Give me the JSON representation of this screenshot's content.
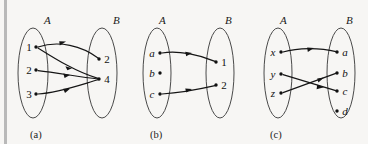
{
  "figure": {
    "background_color": "#f7f6f4",
    "ink_color": "#151515",
    "oval_color": "#4a4a4a",
    "edge_bar_color": "#b9b9b9"
  },
  "panels": [
    {
      "caption": "(a)",
      "domain_label": "A",
      "codomain_label": "B",
      "domain_nodes": [
        {
          "id": "1",
          "label": "1",
          "numeric": true
        },
        {
          "id": "2",
          "label": "2",
          "numeric": true
        },
        {
          "id": "3",
          "label": "3",
          "numeric": true
        }
      ],
      "codomain_nodes": [
        {
          "id": "2",
          "label": "2",
          "numeric": true
        },
        {
          "id": "4",
          "label": "4",
          "numeric": true
        }
      ],
      "arrows": [
        {
          "from": "1",
          "to": "2"
        },
        {
          "from": "1",
          "to": "4"
        },
        {
          "from": "2",
          "to": "4"
        },
        {
          "from": "3",
          "to": "4"
        }
      ]
    },
    {
      "caption": "(b)",
      "domain_label": "A",
      "codomain_label": "B",
      "domain_nodes": [
        {
          "id": "a",
          "label": "a",
          "numeric": false
        },
        {
          "id": "b",
          "label": "b",
          "numeric": false
        },
        {
          "id": "c",
          "label": "c",
          "numeric": false
        }
      ],
      "codomain_nodes": [
        {
          "id": "1",
          "label": "1",
          "numeric": true
        },
        {
          "id": "2",
          "label": "2",
          "numeric": true
        }
      ],
      "arrows": [
        {
          "from": "a",
          "to": "1"
        },
        {
          "from": "c",
          "to": "2"
        }
      ]
    },
    {
      "caption": "(c)",
      "domain_label": "A",
      "codomain_label": "B",
      "domain_nodes": [
        {
          "id": "x",
          "label": "x",
          "numeric": false
        },
        {
          "id": "y",
          "label": "y",
          "numeric": false
        },
        {
          "id": "z",
          "label": "z",
          "numeric": false
        }
      ],
      "codomain_nodes": [
        {
          "id": "a",
          "label": "a",
          "numeric": false
        },
        {
          "id": "b",
          "label": "b",
          "numeric": false
        },
        {
          "id": "c",
          "label": "c",
          "numeric": false
        },
        {
          "id": "d",
          "label": "d",
          "numeric": false
        }
      ],
      "arrows": [
        {
          "from": "x",
          "to": "a"
        },
        {
          "from": "y",
          "to": "c"
        },
        {
          "from": "z",
          "to": "b"
        }
      ]
    }
  ]
}
